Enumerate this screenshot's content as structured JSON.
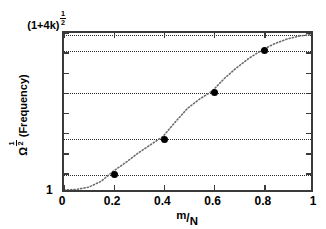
{
  "chart_data": {
    "type": "line",
    "title": "",
    "subtitle": "",
    "xlabel_parts": {
      "numerator": "m",
      "slash": "/",
      "denominator": "N"
    },
    "xlabel": "m/N",
    "ylabel_parts": {
      "symbol": "Ω",
      "exponent_num": "1",
      "exponent_den": "2",
      "suffix": "(Frequency)"
    },
    "ylabel": "Ω^(1/2) (Frequency)",
    "x": [
      0.2,
      0.4,
      0.6,
      0.8,
      1.0
    ],
    "values": [
      0.12,
      0.34,
      0.63,
      0.89,
      0.99
    ],
    "series": [
      {
        "name": "normalized frequency",
        "x": [
          0.2,
          0.4,
          0.6,
          0.8,
          1.0
        ],
        "values": [
          0.12,
          0.34,
          0.63,
          0.89,
          0.99
        ]
      }
    ],
    "curve": {
      "style": "dotted",
      "x": [
        0.0,
        0.05,
        0.1,
        0.15,
        0.2,
        0.25,
        0.3,
        0.35,
        0.4,
        0.45,
        0.5,
        0.55,
        0.6,
        0.65,
        0.7,
        0.75,
        0.8,
        0.85,
        0.9,
        0.95,
        1.0
      ],
      "y": [
        0.0,
        0.004,
        0.018,
        0.055,
        0.12,
        0.175,
        0.235,
        0.288,
        0.34,
        0.432,
        0.52,
        0.58,
        0.63,
        0.712,
        0.78,
        0.84,
        0.89,
        0.93,
        0.96,
        0.98,
        0.99
      ]
    },
    "xlim": [
      0,
      1
    ],
    "ylim_labels": {
      "min": "1",
      "max": "(1+4k)^(1/2)"
    },
    "ylim_max_parts": {
      "base": "(1+4k)",
      "exp_num": "1",
      "exp_den": "2"
    },
    "xticks": [
      0,
      0.2,
      0.4,
      0.6,
      0.8,
      1
    ],
    "xtick_labels": [
      "0",
      "0.2",
      "0.4",
      "0.6",
      "0.8",
      "1"
    ],
    "yticks_normalized": [
      0.0,
      0.125,
      0.25,
      0.375,
      0.5,
      0.625,
      0.75,
      0.875,
      1.0
    ],
    "ytick_labels": [
      "1",
      "",
      "",
      "",
      "",
      "",
      "",
      "",
      "(1+4k)^(1/2)"
    ],
    "guidelines_normalized": [
      0.12,
      0.34,
      0.63,
      0.89,
      0.99
    ],
    "grid": false,
    "legend": null,
    "legend_position": "none",
    "colors": {
      "axis": "#3a3a3a",
      "curve": "#6b6b6b",
      "marker": "#000000",
      "guideline": "#2b2b2b",
      "background": "#ffffff"
    }
  }
}
